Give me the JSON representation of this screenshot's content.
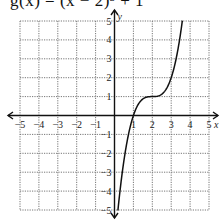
{
  "title": "g(x) = (x − 2)³ + 1",
  "chart_data": {
    "type": "line",
    "title": "g(x) = (x − 2)³ + 1",
    "function": "(x-2)^3 + 1",
    "xlabel": "x",
    "ylabel": "y",
    "xlim": [
      -5,
      5
    ],
    "ylim": [
      -5,
      5
    ],
    "grid": true,
    "x_ticks": [
      -5,
      -4,
      -3,
      -2,
      -1,
      1,
      2,
      3,
      4,
      5
    ],
    "y_ticks": [
      -5,
      -4,
      -3,
      -2,
      -1,
      1,
      2,
      3,
      4,
      5
    ],
    "series": [
      {
        "name": "g(x)",
        "x": [
          0.18,
          0.5,
          1,
          1.5,
          2,
          2.5,
          3,
          3.5,
          3.59
        ],
        "y": [
          -5.0,
          -2.375,
          0,
          0.875,
          1,
          1.125,
          2,
          4.375,
          5.0
        ]
      }
    ]
  },
  "layout": {
    "origin_px": [
      114.5,
      115.5
    ],
    "unit_px": 18.9,
    "grid_left": 20,
    "grid_top": 21,
    "grid_right": 209,
    "grid_bottom": 210
  }
}
